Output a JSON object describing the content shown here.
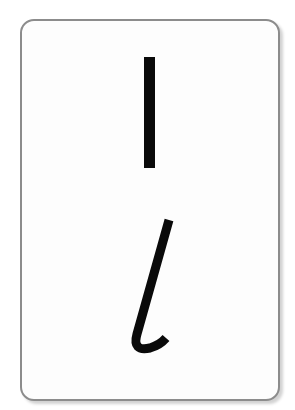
{
  "card": {
    "uppercase_letter": "I",
    "lowercase_letter": "l",
    "ink_color": "#0a0a0a",
    "border_color": "#8c8c8c"
  }
}
